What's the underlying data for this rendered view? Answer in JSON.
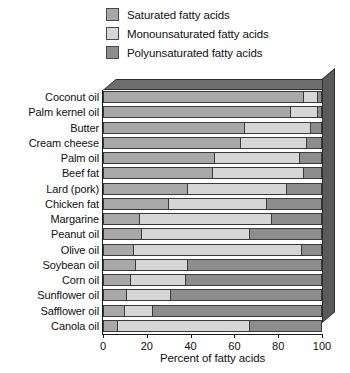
{
  "legend": {
    "items": [
      {
        "label": "Saturated fatty acids",
        "key": "sat",
        "color": "#a8a8a8"
      },
      {
        "label": "Monounsaturated fatty acids",
        "key": "mono",
        "color": "#d6d6d6"
      },
      {
        "label": "Polyunsaturated fatty acids",
        "key": "poly",
        "color": "#8d8d8d"
      }
    ]
  },
  "axis": {
    "x_label": "Percent of fatty acids",
    "x_ticks": [
      0,
      20,
      40,
      60,
      80,
      100
    ],
    "x_min": 0,
    "x_max": 100
  },
  "chart_data": {
    "type": "bar",
    "orientation": "horizontal",
    "stacked": true,
    "title": "",
    "xlabel": "Percent of fatty acids",
    "ylabel": "",
    "xlim": [
      0,
      100
    ],
    "xticks": [
      0,
      20,
      40,
      60,
      80,
      100
    ],
    "grid": false,
    "legend_position": "top",
    "categories": [
      "Coconut oil",
      "Palm kernel oil",
      "Butter",
      "Cream cheese",
      "Palm oil",
      "Beef fat",
      "Lard (pork)",
      "Chicken fat",
      "Margarine",
      "Peanut oil",
      "Olive oil",
      "Soybean oil",
      "Corn oil",
      "Sunflower oil",
      "Safflower oil",
      "Canola oil"
    ],
    "series": [
      {
        "name": "Saturated fatty acids",
        "color": "#a8a8a8",
        "values": [
          92,
          86,
          65,
          63,
          51,
          50,
          39,
          30,
          17,
          18,
          14,
          15,
          13,
          11,
          10,
          7
        ]
      },
      {
        "name": "Monounsaturated fatty acids",
        "color": "#d6d6d6",
        "values": [
          6,
          12,
          30,
          30,
          39,
          42,
          45,
          45,
          60,
          49,
          77,
          24,
          25,
          20,
          13,
          60
        ]
      },
      {
        "name": "Polyunsaturated fatty acids",
        "color": "#8d8d8d",
        "values": [
          2,
          2,
          5,
          7,
          10,
          8,
          16,
          25,
          23,
          33,
          9,
          61,
          62,
          69,
          77,
          33
        ]
      }
    ]
  }
}
